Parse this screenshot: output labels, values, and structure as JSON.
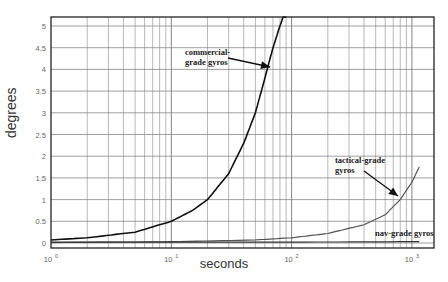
{
  "chart_data": {
    "type": "line",
    "title": "",
    "xlabel": "seconds",
    "ylabel": "degrees",
    "xscale": "log",
    "xlim": [
      1,
      1400
    ],
    "ylim": [
      0,
      5.2
    ],
    "grid": true,
    "x_ticks": [
      "10^0",
      "10^1",
      "10^2",
      "10^3"
    ],
    "y_ticks": [
      "0",
      "0.5",
      "1",
      "1.5",
      "2",
      "2.5",
      "3",
      "3.5",
      "4",
      "4.5",
      "5"
    ],
    "series": [
      {
        "name": "commercial-grade gyros",
        "color": "#111111",
        "x": [
          1,
          2,
          5,
          10,
          15,
          20,
          30,
          40,
          50,
          60,
          70,
          80,
          90
        ],
        "y": [
          0.07,
          0.12,
          0.25,
          0.5,
          0.75,
          1.0,
          1.6,
          2.3,
          3.0,
          3.8,
          4.5,
          5.0,
          5.4
        ]
      },
      {
        "name": "tactical-grade gyros",
        "color": "#555555",
        "x": [
          1,
          10,
          50,
          100,
          200,
          400,
          600,
          800,
          1000,
          1150
        ],
        "y": [
          0.01,
          0.03,
          0.07,
          0.12,
          0.22,
          0.42,
          0.65,
          1.0,
          1.4,
          1.75
        ]
      },
      {
        "name": "nav-grade gyros",
        "color": "#333333",
        "x": [
          1,
          10,
          100,
          1000,
          1150
        ],
        "y": [
          0.02,
          0.02,
          0.02,
          0.03,
          0.03
        ]
      }
    ],
    "annotations": [
      {
        "text_lines": [
          "commercial-",
          "grade gyros"
        ],
        "arrow_to_series": "commercial-grade gyros"
      },
      {
        "text_lines": [
          "tactical-grade",
          "gyros"
        ],
        "arrow_to_series": "tactical-grade gyros"
      },
      {
        "text_lines": [
          "nav-grade gyros"
        ],
        "arrow_to_series": null
      }
    ]
  }
}
